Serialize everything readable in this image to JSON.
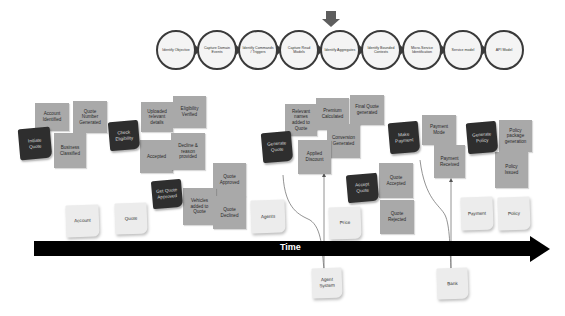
{
  "process": {
    "steps": [
      {
        "label": "Identify Objective"
      },
      {
        "label": "Capture Domain Events"
      },
      {
        "label": "Identify Commands / Triggers"
      },
      {
        "label": "Capture Read Models"
      },
      {
        "label": "Identify Aggregates"
      },
      {
        "label": "Identify Bounded Contexts"
      },
      {
        "label": "Micro-Service Identification"
      },
      {
        "label": "Service model"
      },
      {
        "label": "API Model"
      }
    ],
    "current_step_index": 4
  },
  "notes": {
    "grey": [
      {
        "label": "Account Identified"
      },
      {
        "label": "Quote Number Generated"
      },
      {
        "label": "Business Classified"
      },
      {
        "label": "Uploaded relevant details"
      },
      {
        "label": "Eligibility Verified"
      },
      {
        "label": "Accepted"
      },
      {
        "label": "Decline & reason provided"
      },
      {
        "label": "Quote Approved"
      },
      {
        "label": "Vehicles added to Quote"
      },
      {
        "label": "Quote Declined"
      },
      {
        "label": "Relevant names added to Quote"
      },
      {
        "label": "Premium Calculated"
      },
      {
        "label": "Final Quote generated"
      },
      {
        "label": "Conversion Generated"
      },
      {
        "label": "Applied Discount"
      },
      {
        "label": "Quote Accepted"
      },
      {
        "label": "Quote Rejected"
      },
      {
        "label": "Payment Mode"
      },
      {
        "label": "Payment Received"
      },
      {
        "label": "Policy package generation"
      },
      {
        "label": "Policy Issued"
      }
    ],
    "dark": [
      {
        "label": "Initiate Quote"
      },
      {
        "label": "Check Eligibility"
      },
      {
        "label": "Get Quote Approved"
      },
      {
        "label": "Generate Quote"
      },
      {
        "label": "Accept Quote"
      },
      {
        "label": "Make Payment"
      },
      {
        "label": "Generate Policy"
      }
    ],
    "aggregates": [
      {
        "label": "Account"
      },
      {
        "label": "Quote"
      },
      {
        "label": "Agents"
      },
      {
        "label": "Price"
      },
      {
        "label": "Payment"
      },
      {
        "label": "Policy"
      }
    ],
    "external": [
      {
        "label": "Agent System"
      },
      {
        "label": "Bank"
      }
    ]
  },
  "timeline": {
    "label": "Time"
  },
  "colors": {
    "event_grey": "#a9a9a9",
    "command_dark": "#2e2e2e",
    "aggregate_pale": "#ececec",
    "timeline": "#000000",
    "circle_border": "#3a3a3a"
  }
}
